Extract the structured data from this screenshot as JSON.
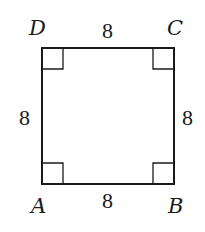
{
  "diagram": {
    "type": "square",
    "stroke_color": "#1a1a1a",
    "vertices": {
      "A": {
        "label": "A",
        "x": 42,
        "y": 184
      },
      "B": {
        "label": "B",
        "x": 174,
        "y": 184
      },
      "C": {
        "label": "C",
        "x": 174,
        "y": 48
      },
      "D": {
        "label": "D",
        "x": 42,
        "y": 48
      }
    },
    "sides": {
      "top": {
        "label": "8",
        "from": "D",
        "to": "C"
      },
      "bottom": {
        "label": "8",
        "from": "A",
        "to": "B"
      },
      "left": {
        "label": "8",
        "from": "A",
        "to": "D"
      },
      "right": {
        "label": "8",
        "from": "B",
        "to": "C"
      }
    },
    "right_angle_markers": [
      "A",
      "B",
      "C",
      "D"
    ],
    "marker_size": 21
  }
}
